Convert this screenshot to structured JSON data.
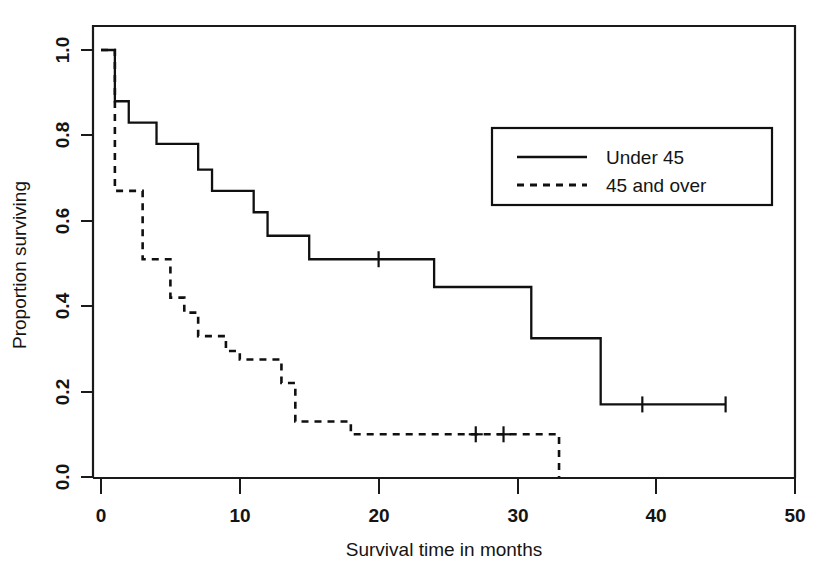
{
  "chart_data": {
    "type": "line",
    "plot_style": "kaplan-meier-step",
    "title": "",
    "xlabel": "Survival time in months",
    "ylabel": "Proportion surviving",
    "xlim": [
      0,
      50
    ],
    "ylim": [
      0.0,
      1.0
    ],
    "xticks": [
      0,
      10,
      20,
      30,
      40,
      50
    ],
    "xticklabels": [
      "0",
      "10",
      "20",
      "30",
      "40",
      "50"
    ],
    "yticks": [
      0.0,
      0.2,
      0.4,
      0.6,
      0.8,
      1.0
    ],
    "yticklabels": [
      "0.0",
      "0.2",
      "0.4",
      "0.6",
      "0.8",
      "1.0"
    ],
    "grid": false,
    "legend_position": "upper right",
    "series": [
      {
        "name": "Under 45",
        "linestyle": "solid",
        "color": "#101010",
        "x": [
          0,
          1,
          2,
          4,
          7,
          8,
          11,
          12,
          15,
          18,
          24,
          31,
          36,
          45
        ],
        "y": [
          1.0,
          0.88,
          0.83,
          0.78,
          0.72,
          0.67,
          0.62,
          0.565,
          0.51,
          0.51,
          0.445,
          0.325,
          0.17,
          0.17
        ],
        "censored_x": [
          20,
          39,
          45
        ],
        "censored_y": [
          0.51,
          0.17,
          0.17
        ]
      },
      {
        "name": "45 and over",
        "linestyle": "dashed",
        "color": "#101010",
        "x": [
          0,
          1,
          3,
          5,
          6,
          7,
          9,
          10,
          13,
          14,
          18,
          33
        ],
        "y": [
          1.0,
          0.67,
          0.51,
          0.42,
          0.385,
          0.33,
          0.295,
          0.275,
          0.22,
          0.13,
          0.1,
          0.0
        ],
        "censored_x": [
          27,
          29
        ],
        "censored_y": [
          0.1,
          0.1
        ]
      }
    ]
  },
  "legend": {
    "entries": [
      {
        "label": "Under 45",
        "style": "solid"
      },
      {
        "label": "45 and over",
        "style": "dashed"
      }
    ]
  },
  "axes": {
    "x_title": "Survival time in months",
    "y_title": "Proportion surviving",
    "x_tick_labels": [
      "0",
      "10",
      "20",
      "30",
      "40",
      "50"
    ],
    "y_tick_labels": [
      "0.0",
      "0.2",
      "0.4",
      "0.6",
      "0.8",
      "1.0"
    ]
  },
  "colors": {
    "ink": "#101010",
    "background": "#ffffff"
  }
}
